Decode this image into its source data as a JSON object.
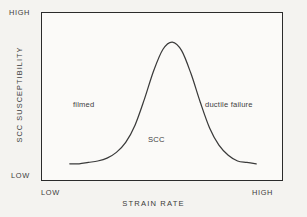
{
  "chart_data": {
    "type": "line",
    "title": "",
    "xlabel": "STRAIN RATE",
    "ylabel": "SCC SUSCEPTIBILITY",
    "x_tick_labels": [
      "LOW",
      "HIGH"
    ],
    "y_tick_labels": [
      "LOW",
      "HIGH"
    ],
    "xlim": [
      0,
      1
    ],
    "ylim": [
      0,
      1
    ],
    "grid": false,
    "legend": null,
    "series": [
      {
        "name": "SCC susceptibility",
        "description": "bell-shaped curve peaking at intermediate strain rate",
        "x": [
          0.0,
          0.05,
          0.1,
          0.15,
          0.2,
          0.25,
          0.3,
          0.35,
          0.4,
          0.45,
          0.5,
          0.55,
          0.6,
          0.65,
          0.7,
          0.75,
          0.8,
          0.85,
          0.9,
          0.95,
          1.0
        ],
        "y": [
          0.03,
          0.03,
          0.04,
          0.05,
          0.07,
          0.11,
          0.18,
          0.3,
          0.48,
          0.68,
          0.83,
          0.88,
          0.82,
          0.66,
          0.46,
          0.28,
          0.16,
          0.09,
          0.05,
          0.04,
          0.03
        ]
      }
    ],
    "annotations": [
      {
        "text": "filmed",
        "x": 0.18,
        "y": 0.53
      },
      {
        "text": "SCC",
        "x": 0.5,
        "y": 0.28
      },
      {
        "text": "ductile failure",
        "x": 0.78,
        "y": 0.53
      }
    ],
    "colors": {
      "curve": "#3a3a3a",
      "frame": "#2b2b2b",
      "text": "#3a3a3a",
      "background": "#f4f3f0",
      "plot_background": "#fbfaf8"
    }
  },
  "axes": {
    "y_high": "HIGH",
    "y_low": "LOW",
    "x_low": "LOW",
    "x_high": "HIGH",
    "x_title": "STRAIN RATE",
    "y_title": "SCC SUSCEPTIBILITY"
  },
  "annotations": {
    "left": "filmed",
    "center": "SCC",
    "right": "ductile failure"
  }
}
